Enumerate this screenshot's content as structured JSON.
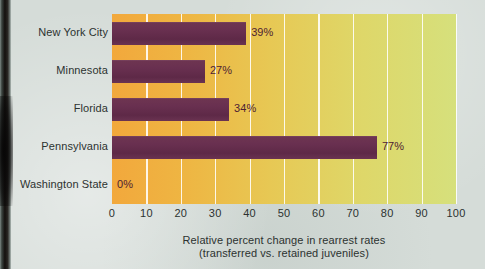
{
  "chart_data": {
    "type": "bar",
    "orientation": "horizontal",
    "title": "",
    "subtitle": "",
    "xlabel": "Relative percent change in rearrest rates",
    "xlabel_line2": "(transferred vs. retained juveniles)",
    "ylabel": "",
    "categories": [
      "New York City",
      "Minnesota",
      "Florida",
      "Pennsylvania",
      "Washington State"
    ],
    "values": [
      39,
      27,
      34,
      77,
      0
    ],
    "value_labels": [
      "39%",
      "27%",
      "34%",
      "77%",
      "0%"
    ],
    "xlim": [
      0,
      100
    ],
    "xticks": [
      0,
      10,
      20,
      30,
      40,
      50,
      60,
      70,
      80,
      90,
      100
    ],
    "xtick_labels": [
      "0",
      "10",
      "20",
      "30",
      "40",
      "50",
      "60",
      "70",
      "80",
      "90",
      "100"
    ],
    "grid": "vertical-only",
    "legend": "none",
    "colors": {
      "bar": "#693050",
      "plot_gradient_start": "#f2a83c",
      "plot_gradient_end": "#d6e07c",
      "gridline": "#ffffff",
      "page_background": "#d5dcd8",
      "text": "#2c3230",
      "value_label_text": "#4e2233"
    }
  },
  "icons": {
    "page_gutter": "book-spine-shadow"
  }
}
